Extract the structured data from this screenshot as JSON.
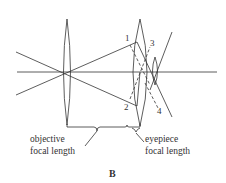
{
  "figure": {
    "label": "B"
  },
  "lenses": [
    {
      "name": "objective",
      "role": "objective-lens"
    },
    {
      "name": "eyepiece",
      "role": "eyepiece-lens"
    },
    {
      "name": "eye",
      "role": "small-lens"
    }
  ],
  "ray_labels": [
    "1",
    "2",
    "3",
    "4"
  ],
  "annotations": {
    "objective": {
      "line1": "objective",
      "line2": "focal length"
    },
    "eyepiece": {
      "line1": "eyepiece",
      "line2": "focal length"
    }
  }
}
